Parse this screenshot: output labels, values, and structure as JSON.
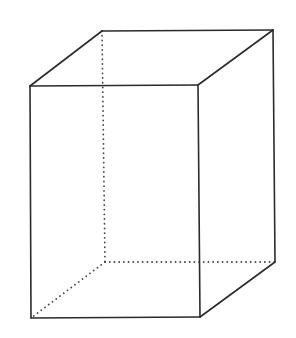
{
  "diagram": {
    "type": "rectangular-prism",
    "colors": {
      "background": "#ffffff",
      "visible_edge": "#2b2b2b",
      "hidden_edge": "#4a4a4a"
    },
    "vertices": {
      "front_top_left": [
        30,
        86
      ],
      "front_top_right": [
        198,
        85
      ],
      "front_bottom_right": [
        200,
        317
      ],
      "front_bottom_left": [
        31,
        318
      ],
      "back_top_left": [
        102,
        31
      ],
      "back_top_right": [
        273,
        30
      ],
      "back_bottom_right": [
        275,
        262
      ],
      "back_bottom_left": [
        105,
        262
      ]
    },
    "visible_edges": [
      [
        "front_top_left",
        "front_top_right"
      ],
      [
        "front_top_right",
        "front_bottom_right"
      ],
      [
        "front_bottom_right",
        "front_bottom_left"
      ],
      [
        "front_bottom_left",
        "front_top_left"
      ],
      [
        "back_top_left",
        "back_top_right"
      ],
      [
        "back_top_right",
        "back_bottom_right"
      ],
      [
        "front_top_left",
        "back_top_left"
      ],
      [
        "front_top_right",
        "back_top_right"
      ],
      [
        "front_bottom_right",
        "back_bottom_right"
      ]
    ],
    "hidden_edges": [
      [
        "back_top_left",
        "back_bottom_left"
      ],
      [
        "back_bottom_left",
        "back_bottom_right"
      ],
      [
        "back_bottom_left",
        "front_bottom_left"
      ]
    ]
  }
}
